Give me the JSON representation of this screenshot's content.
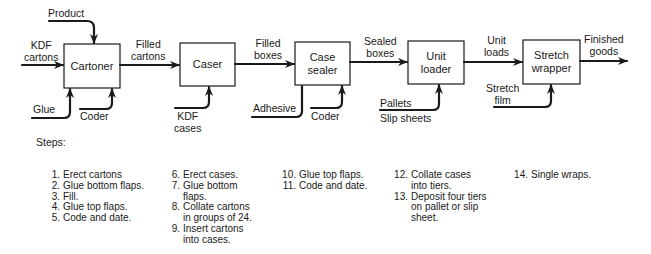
{
  "diagram": {
    "machines": [
      {
        "id": "cartoner",
        "label": "Cartoner"
      },
      {
        "id": "caser",
        "label": "Caser"
      },
      {
        "id": "case_sealer",
        "label": "Case\nsealer"
      },
      {
        "id": "unit_loader",
        "label": "Unit\nloader"
      },
      {
        "id": "stretch_wrapper",
        "label": "Stretch\nwrapper"
      }
    ],
    "flows": {
      "kdf_cartons": "KDF\ncartons",
      "product": "Product",
      "filled_cartons": "Filled\ncartons",
      "filled_boxes": "Filled\nboxes",
      "sealed_boxes": "Sealed\nboxes",
      "unit_loads": "Unit\nloads",
      "finished_goods": "Finished\ngoods"
    },
    "inputs": {
      "glue": "Glue",
      "coder1": "Coder",
      "kdf_cases": "KDF\ncases",
      "adhesive": "Adhesive",
      "coder2": "Coder",
      "pallets": "Pallets",
      "slip_sheets": "Slip sheets",
      "stretch_film": "Stretch\nfilm"
    }
  },
  "steps": {
    "title": "Steps:",
    "columns": [
      [
        {
          "n": "1.",
          "text": "Erect cartons"
        },
        {
          "n": "2.",
          "text": "Glue bottom flaps."
        },
        {
          "n": "3.",
          "text": "Fill."
        },
        {
          "n": "4.",
          "text": "Glue top flaps."
        },
        {
          "n": "5.",
          "text": "Code and date."
        }
      ],
      [
        {
          "n": "6.",
          "text": "Erect cases."
        },
        {
          "n": "7.",
          "text": "Glue bottom\nflaps."
        },
        {
          "n": "8.",
          "text": "Collate cartons\nin groups of 24."
        },
        {
          "n": "9.",
          "text": "Insert cartons\ninto cases."
        }
      ],
      [
        {
          "n": "10.",
          "text": "Glue top flaps."
        },
        {
          "n": "11.",
          "text": "Code and date."
        }
      ],
      [
        {
          "n": "12.",
          "text": "Collate cases\ninto tiers."
        },
        {
          "n": "13.",
          "text": "Deposit four tiers\non pallet or slip\nsheet."
        }
      ],
      [
        {
          "n": "14.",
          "text": "Single wraps."
        }
      ]
    ]
  }
}
